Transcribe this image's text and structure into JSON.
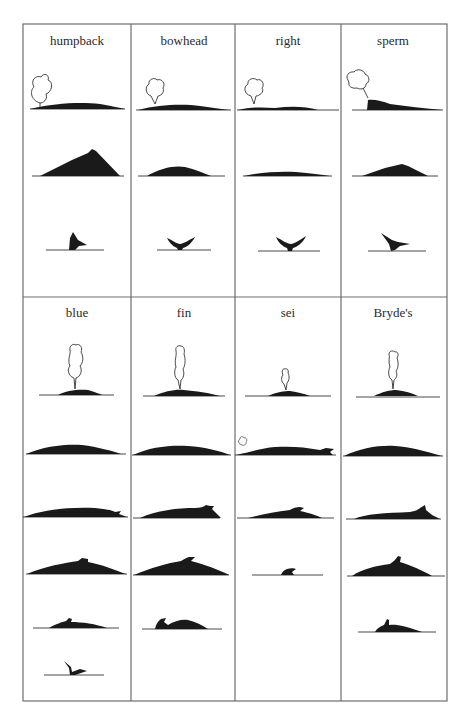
{
  "figure": {
    "top_section": {
      "columns": [
        {
          "label": "humpback",
          "frames": [
            "blow",
            "arched-back",
            "fluke-up"
          ]
        },
        {
          "label": "bowhead",
          "frames": [
            "blow",
            "rounded-back",
            "fluke-up"
          ]
        },
        {
          "label": "right",
          "frames": [
            "blow",
            "low-back",
            "fluke-up"
          ]
        },
        {
          "label": "sperm",
          "frames": [
            "angled-blow",
            "back",
            "fluke-up"
          ]
        }
      ]
    },
    "bottom_section": {
      "columns": [
        {
          "label": "blue",
          "frames": [
            "blow",
            "back",
            "back-with-small-fin",
            "arched-back",
            "dive",
            "fluke-up"
          ]
        },
        {
          "label": "fin",
          "frames": [
            "blow",
            "back",
            "back-with-fin",
            "arched-back-with-fin",
            "dive"
          ]
        },
        {
          "label": "sei",
          "frames": [
            "blow",
            "back-with-small-blow",
            "back-with-fin",
            "fin-only"
          ]
        },
        {
          "label": "Bryde's",
          "frames": [
            "blow",
            "back",
            "back-with-fin",
            "arched-back-with-fin",
            "dive"
          ]
        }
      ]
    },
    "colors": {
      "silhouette": "#1a1a1a",
      "grid_line": "#6e6e6e",
      "label": "#2a2a2a",
      "background": "#ffffff"
    }
  }
}
